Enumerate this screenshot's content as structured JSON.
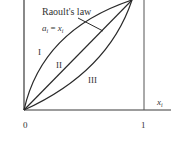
{
  "diagram": {
    "law_label": "Raoult's law",
    "equation": {
      "lhs": "a",
      "lhs_sub": "i",
      "eq": " = ",
      "rhs": "x",
      "rhs_sub": "i"
    },
    "regions": [
      "I",
      "II",
      "III"
    ],
    "x_axis": {
      "label": "x",
      "label_sub": "i",
      "ticks": [
        "0",
        "1"
      ]
    },
    "colors": {
      "line": "#2a2a2a",
      "axis": "#3a3a3a"
    }
  }
}
